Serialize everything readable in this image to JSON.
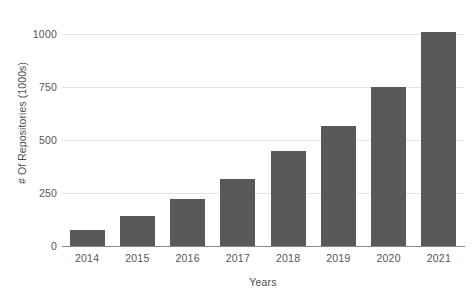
{
  "chart_data": {
    "type": "bar",
    "title": "",
    "xlabel": "Years",
    "ylabel": "# Of Repositories (1000s)",
    "categories": [
      "2014",
      "2015",
      "2016",
      "2017",
      "2018",
      "2019",
      "2020",
      "2021"
    ],
    "values": [
      75,
      140,
      220,
      315,
      450,
      565,
      750,
      1010
    ],
    "ylim": [
      0,
      1062
    ],
    "yticks": [
      0,
      250,
      500,
      750,
      1000
    ],
    "ytick_labels": [
      "0",
      "250",
      "500",
      "750",
      "1000"
    ],
    "grid": true,
    "legend": false,
    "legend_position": "none",
    "bar_color": "#595959",
    "gridline_color": "#e3e3e3",
    "axis_color": "#8a8a8a",
    "background_color": "#ffffff",
    "text_color": "#555555"
  }
}
